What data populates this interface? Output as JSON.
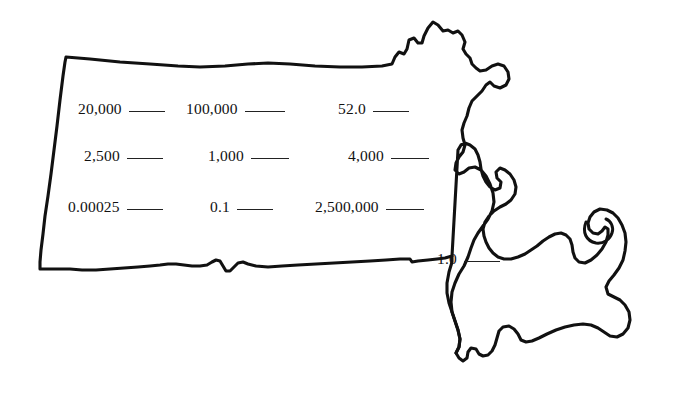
{
  "page": {
    "background_color": "#ffffff",
    "outline_color": "#111111",
    "text_color": "#111111"
  },
  "map": {
    "name": "massachusetts-outline",
    "description": "Outline map of the state of Massachusetts including Cape Cod and Cape Ann"
  },
  "worksheet": {
    "rows": [
      {
        "items": [
          {
            "value": "20,000",
            "blank_width": 36
          },
          {
            "value": "100,000",
            "blank_width": 40
          },
          {
            "value": "52.0",
            "blank_width": 36
          }
        ]
      },
      {
        "items": [
          {
            "value": "2,500",
            "blank_width": 36
          },
          {
            "value": "1,000",
            "blank_width": 38
          },
          {
            "value": "4,000",
            "blank_width": 38
          }
        ]
      },
      {
        "items": [
          {
            "value": "0.00025",
            "blank_width": 36
          },
          {
            "value": "0.1",
            "blank_width": 36
          },
          {
            "value": "2,500,000",
            "blank_width": 38
          }
        ]
      },
      {
        "items": [
          {
            "value": "1.0",
            "blank_width": 36
          }
        ]
      }
    ]
  }
}
